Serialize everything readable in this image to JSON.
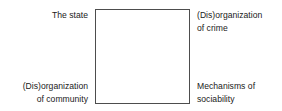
{
  "figure": {
    "width": 282,
    "height": 111,
    "background_color": "#ffffff",
    "type": "four-corner-square-diagram"
  },
  "square": {
    "name": "central square",
    "border_color": "#4d4d4d",
    "fill_color": "#ffffff",
    "border_width_px": 1,
    "x": 95,
    "y": 9,
    "width": 95,
    "height": 95
  },
  "labels": {
    "top_left": "The state",
    "top_right": "(Dis)organization\nof crime",
    "bottom_left": "(Dis)organization\nof community",
    "bottom_right": "Mechanisms of\nsociability"
  },
  "text_color": "#1a1a1a"
}
